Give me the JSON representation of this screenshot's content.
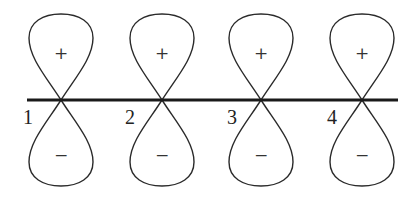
{
  "diagram": {
    "type": "p-orbital array",
    "axis": {
      "y": 100,
      "x_start": 27,
      "x_end": 398
    },
    "orbitals": [
      {
        "label": "1",
        "cx": 61,
        "top_sign": "+",
        "bottom_sign": "−",
        "label_x": 28,
        "label_y": 124
      },
      {
        "label": "2",
        "cx": 162,
        "top_sign": "+",
        "bottom_sign": "−",
        "label_x": 130,
        "label_y": 124
      },
      {
        "label": "3",
        "cx": 261,
        "top_sign": "+",
        "bottom_sign": "−",
        "label_x": 232,
        "label_y": 124
      },
      {
        "label": "4",
        "cx": 362,
        "top_sign": "+",
        "bottom_sign": "−",
        "label_x": 332,
        "label_y": 124
      }
    ]
  }
}
